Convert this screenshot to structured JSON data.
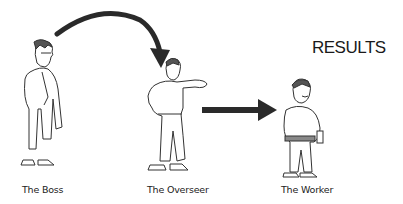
{
  "title": "RESULTS",
  "figures": [
    {
      "id": "boss",
      "label": "The Boss"
    },
    {
      "id": "overseer",
      "label": "The Overseer"
    },
    {
      "id": "worker",
      "label": "The Worker"
    }
  ],
  "arrows": [
    {
      "from": "The Boss",
      "to": "The Overseer",
      "style": "curved"
    },
    {
      "from": "The Overseer",
      "to": "The Worker",
      "style": "straight"
    }
  ],
  "colors": {
    "arrow": "#2a2a2a",
    "ink": "#333333",
    "background": "#ffffff"
  }
}
